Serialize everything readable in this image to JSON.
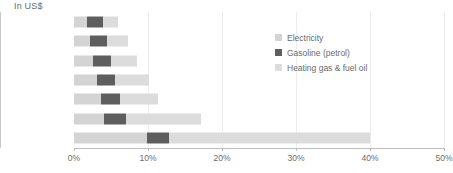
{
  "chart_data": {
    "type": "bar",
    "orientation": "horizontal",
    "stacked": true,
    "title": "",
    "xlabel": "",
    "ylabel": "In US$",
    "xlim": [
      0,
      50
    ],
    "xunit": "%",
    "grid": true,
    "legend_position": "top-right",
    "xticks": [
      "0%",
      "10%",
      "20%",
      "30%",
      "40%",
      "50%"
    ],
    "xtick_values": [
      0,
      10,
      20,
      30,
      40,
      50
    ],
    "categories": [
      ">120k",
      "100k-119k",
      "80k-99k",
      "60k-79k",
      "40k-59k",
      "20k-39k",
      "<20k"
    ],
    "series": [
      {
        "name": "Electricity",
        "color": "#d4d4d4",
        "values": [
          1.7,
          2.1,
          2.6,
          3.1,
          3.6,
          4.1,
          9.8
        ]
      },
      {
        "name": "Gasoline (petrol)",
        "color": "#5e5e5e",
        "values": [
          2.2,
          2.3,
          2.4,
          2.4,
          2.6,
          2.9,
          3.1
        ]
      },
      {
        "name": "Heating gas & fuel oil",
        "color": "#dcdcdc",
        "values": [
          2.1,
          2.9,
          3.5,
          4.6,
          5.2,
          10.1,
          27.1
        ]
      }
    ],
    "totals": [
      6.0,
      7.3,
      8.5,
      10.1,
      11.4,
      17.1,
      40.0
    ]
  },
  "legend": {
    "items": [
      {
        "label": "Electricity"
      },
      {
        "label": "Gasoline (petrol)"
      },
      {
        "label": "Heating gas & fuel oil"
      }
    ]
  }
}
